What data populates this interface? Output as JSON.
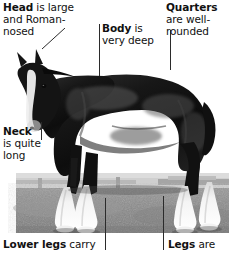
{
  "figure": {
    "photo": {
      "alt": "Black Shire draught horse in profile standing on grass with white feathered lower legs",
      "colors": {
        "horse_body": "#141414",
        "horse_highlight": "#4a4a4a",
        "blaze_white": "#f2f2f2",
        "feather_white": "#fafafa",
        "grass": "#8e8e8e",
        "grass_dark": "#6f6f6f",
        "sky_band": "#c9c9c9",
        "fence": "#a8a8a8",
        "backdrop": "#ffffff"
      }
    }
  },
  "annotations": {
    "head": {
      "term": "Head",
      "text": " is large and Roman-nosed",
      "line1_term": "Head",
      "line1_rest": " is large",
      "line2": "and Roman-",
      "line3": "nosed"
    },
    "body": {
      "term": "Body",
      "line1_rest": " is",
      "line2": "very deep"
    },
    "quarters": {
      "term": "Quarters",
      "line2": "are well-",
      "line3": "rounded"
    },
    "neck": {
      "term": "Neck",
      "line2": "is quite",
      "line3": "long"
    },
    "lower_legs": {
      "term": "Lower legs",
      "rest": " carry"
    },
    "legs": {
      "term": "Legs",
      "rest": " are"
    }
  },
  "leader_lines": {
    "head": "diagonal-to-shoulder",
    "body": "vertical-to-barrel",
    "quarters": "vertical-to-hindquarters",
    "neck": "vertical-to-neck",
    "lower_legs": "vertical-to-front-feather",
    "legs": "vertical-to-hind-leg"
  }
}
